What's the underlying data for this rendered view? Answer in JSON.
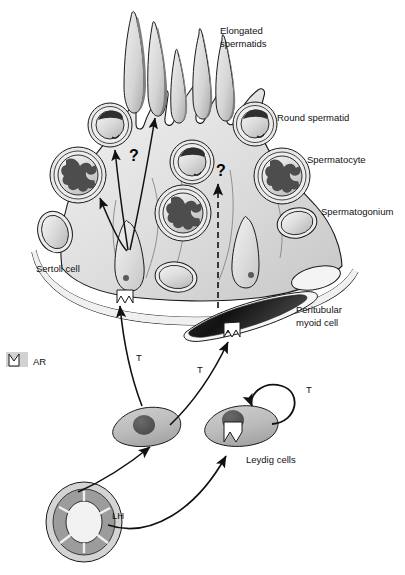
{
  "figure": {
    "background_color": "#ffffff",
    "line_color": "#1a1a1a"
  },
  "palette": {
    "tubule_fill": "#d8d8d8",
    "sertoli_fill": "#e4e4e4",
    "germ_cell_fill": "#d0d0d0",
    "nucleus_dark": "#555555",
    "chromatin_dark": "#4d4d4d",
    "myoid_dark": "#1c1c1c",
    "pituitary_grey": "#8f8f8f",
    "leydig_fill": "#b9b9b9",
    "receptor_fill": "#ffffff",
    "outline": "#1a1a1a"
  },
  "labels": {
    "elongated_spermatids": {
      "line1": "Elongated",
      "line2": "spermatids"
    },
    "round_spermatid": "Round spermatid",
    "spermatocyte": "Spermatocyte",
    "spermatogonium": "Spermatogonium",
    "sertoli_cell": "Sertoli cell",
    "peritubular_myoid": {
      "line1": "Peritubular",
      "line2": "myoid cell"
    },
    "leydig_cells": "Leydig cells",
    "androgen_receptor": "AR"
  },
  "annotations": {
    "question_left": "?",
    "question_right": "?",
    "t_sertoli": "T",
    "t_myoid": "T",
    "t_autocrine": "T",
    "lh": "LH"
  },
  "legend": {
    "symbol_name": "androgen-receptor-symbol",
    "symbol_label": "AR"
  },
  "structures": {
    "elongated_spermatid_count": 5,
    "round_spermatid_count": 3,
    "spermatocyte_count": 3,
    "spermatogonium_count": 4,
    "sertoli_cell_count": 2,
    "leydig_cell_count": 2,
    "peritubular_myoid_cell_count": 1,
    "pituitary_count": 1,
    "solid_arrow_count": 3,
    "dashed_arrow_count": 1
  },
  "signalling": {
    "lh_targets": [
      "Leydig cell left",
      "Leydig cell right"
    ],
    "t_targets": [
      "Sertoli cell AR",
      "Peritubular myoid cell AR",
      "Leydig cell AR (autocrine)"
    ],
    "unknown_pathways": [
      "Sertoli to round spermatid",
      "Sertoli to spermatocyte",
      "Sertoli to elongated spermatid",
      "Myoid to germ cell"
    ]
  }
}
